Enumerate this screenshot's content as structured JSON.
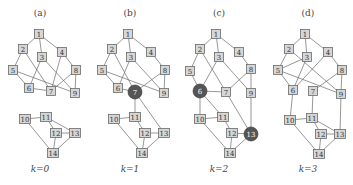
{
  "colors": {
    "node_fill": "#d6d6d6",
    "node_border": "#6a6a6a",
    "highlight_fill": "#555555",
    "edge": "#6a6a6a",
    "text": "#444444"
  },
  "panels": [
    {
      "id": "a",
      "title": "(a)",
      "k_label": "k=0",
      "offset_x": 0,
      "title_x": 40,
      "highlighted": [],
      "nodes": {
        "1": [
          39,
          34
        ],
        "2": [
          23,
          49
        ],
        "3": [
          42,
          57
        ],
        "4": [
          62,
          52
        ],
        "5": [
          13,
          70
        ],
        "6": [
          29,
          88
        ],
        "7": [
          51,
          91
        ],
        "8": [
          76,
          70
        ],
        "9": [
          75,
          93
        ],
        "10": [
          25,
          119
        ],
        "11": [
          46,
          117
        ],
        "12": [
          56,
          133
        ],
        "13": [
          75,
          133
        ],
        "14": [
          53,
          153
        ]
      },
      "edges": [
        [
          1,
          2
        ],
        [
          1,
          3
        ],
        [
          1,
          4
        ],
        [
          2,
          5
        ],
        [
          2,
          7
        ],
        [
          3,
          6
        ],
        [
          3,
          9
        ],
        [
          4,
          7
        ],
        [
          4,
          8
        ],
        [
          5,
          6
        ],
        [
          5,
          9
        ],
        [
          6,
          7
        ],
        [
          7,
          8
        ],
        [
          8,
          9
        ],
        [
          10,
          11
        ],
        [
          10,
          14
        ],
        [
          11,
          12
        ],
        [
          11,
          13
        ],
        [
          12,
          13
        ],
        [
          12,
          14
        ],
        [
          13,
          14
        ]
      ]
    },
    {
      "id": "b",
      "title": "(b)",
      "k_label": "k=1",
      "offset_x": 89,
      "title_x": 130,
      "highlighted": [
        "7"
      ],
      "nodes": {
        "1": [
          39,
          34
        ],
        "2": [
          23,
          49
        ],
        "3": [
          42,
          57
        ],
        "4": [
          62,
          52
        ],
        "5": [
          13,
          70
        ],
        "6": [
          29,
          88
        ],
        "7": [
          46,
          92
        ],
        "8": [
          76,
          70
        ],
        "9": [
          75,
          93
        ],
        "10": [
          25,
          119
        ],
        "11": [
          46,
          117
        ],
        "12": [
          56,
          133
        ],
        "13": [
          75,
          133
        ],
        "14": [
          53,
          153
        ]
      },
      "edges": [
        [
          1,
          2
        ],
        [
          1,
          3
        ],
        [
          1,
          4
        ],
        [
          2,
          5
        ],
        [
          2,
          7
        ],
        [
          3,
          6
        ],
        [
          3,
          9
        ],
        [
          4,
          8
        ],
        [
          5,
          6
        ],
        [
          5,
          9
        ],
        [
          6,
          7
        ],
        [
          7,
          8
        ],
        [
          8,
          9
        ],
        [
          7,
          11
        ],
        [
          7,
          13
        ],
        [
          10,
          11
        ],
        [
          10,
          14
        ],
        [
          11,
          12
        ],
        [
          12,
          13
        ],
        [
          12,
          14
        ],
        [
          13,
          14
        ]
      ]
    },
    {
      "id": "c",
      "title": "(c)",
      "k_label": "k=2",
      "offset_x": 178,
      "title_x": 219,
      "highlighted": [
        "6",
        "13"
      ],
      "nodes": {
        "1": [
          38,
          34
        ],
        "2": [
          22,
          49
        ],
        "3": [
          41,
          57
        ],
        "4": [
          61,
          52
        ],
        "5": [
          12,
          71
        ],
        "6": [
          22,
          91
        ],
        "7": [
          48,
          92
        ],
        "8": [
          73,
          69
        ],
        "9": [
          73,
          93
        ],
        "10": [
          22,
          119
        ],
        "11": [
          45,
          117
        ],
        "12": [
          54,
          133
        ],
        "13": [
          73,
          134
        ],
        "14": [
          52,
          153
        ]
      },
      "edges": [
        [
          1,
          2
        ],
        [
          1,
          3
        ],
        [
          1,
          4
        ],
        [
          2,
          5
        ],
        [
          2,
          7
        ],
        [
          3,
          6
        ],
        [
          3,
          9
        ],
        [
          4,
          8
        ],
        [
          5,
          6
        ],
        [
          6,
          7
        ],
        [
          7,
          8
        ],
        [
          8,
          9
        ],
        [
          6,
          10
        ],
        [
          6,
          11
        ],
        [
          7,
          13
        ],
        [
          9,
          13
        ],
        [
          10,
          11
        ],
        [
          10,
          14
        ],
        [
          11,
          12
        ],
        [
          12,
          13
        ],
        [
          12,
          14
        ],
        [
          13,
          14
        ]
      ]
    },
    {
      "id": "d",
      "title": "(d)",
      "k_label": "k=3",
      "offset_x": 265,
      "title_x": 308,
      "highlighted": [],
      "nodes": {
        "1": [
          40,
          34
        ],
        "2": [
          24,
          49
        ],
        "3": [
          42,
          57
        ],
        "4": [
          63,
          52
        ],
        "5": [
          13,
          70
        ],
        "6": [
          28,
          90
        ],
        "7": [
          48,
          91
        ],
        "8": [
          77,
          70
        ],
        "9": [
          76,
          94
        ],
        "10": [
          25,
          120
        ],
        "11": [
          47,
          118
        ],
        "12": [
          56,
          134
        ],
        "13": [
          75,
          134
        ],
        "14": [
          54,
          154
        ]
      },
      "edges": [
        [
          1,
          2
        ],
        [
          1,
          3
        ],
        [
          1,
          4
        ],
        [
          2,
          5
        ],
        [
          2,
          9
        ],
        [
          3,
          5
        ],
        [
          3,
          6
        ],
        [
          4,
          6
        ],
        [
          4,
          8
        ],
        [
          5,
          6
        ],
        [
          5,
          9
        ],
        [
          7,
          8
        ],
        [
          8,
          9
        ],
        [
          6,
          10
        ],
        [
          7,
          11
        ],
        [
          9,
          13
        ],
        [
          10,
          11
        ],
        [
          10,
          14
        ],
        [
          11,
          12
        ],
        [
          11,
          13
        ],
        [
          12,
          13
        ],
        [
          12,
          14
        ],
        [
          13,
          14
        ]
      ]
    }
  ]
}
